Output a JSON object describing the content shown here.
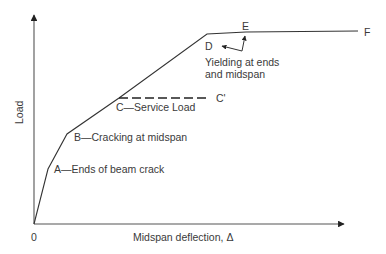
{
  "diagram": {
    "type": "load-deflection curve",
    "axes": {
      "x_label": "Midspan deflection, Δ",
      "y_label": "Load",
      "origin_label": "0"
    },
    "points": [
      {
        "id": "O",
        "x": 34,
        "y": 224
      },
      {
        "id": "A",
        "x": 48,
        "y": 169,
        "label": "A—Ends of beam crack"
      },
      {
        "id": "B",
        "x": 67,
        "y": 134,
        "label": "B—Cracking at midspan"
      },
      {
        "id": "C",
        "x": 119,
        "y": 98,
        "label": "C—Service Load"
      },
      {
        "id": "D",
        "x": 207,
        "y": 34,
        "label": "D"
      },
      {
        "id": "E",
        "x": 246,
        "y": 32,
        "label": "E"
      },
      {
        "id": "F",
        "x": 358,
        "y": 31,
        "label": "F"
      }
    ],
    "service_line": {
      "from": "C",
      "to_label": "C'"
    },
    "annotation": {
      "line1": "Yielding at ends",
      "line2": "and midspan"
    }
  },
  "labels": {
    "A": "A—Ends of beam crack",
    "B": "B—Cracking at midspan",
    "C": "C—Service Load",
    "C_prime": "C'",
    "D": "D",
    "E": "E",
    "F": "F",
    "yield1": "Yielding at ends",
    "yield2": "and midspan",
    "x_axis": "Midspan deflection, Δ",
    "y_axis": "Load",
    "origin": "0"
  }
}
